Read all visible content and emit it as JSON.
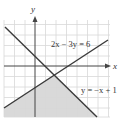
{
  "graph": {
    "axis_labels": {
      "x": "x",
      "y": "y"
    },
    "equations": [
      {
        "label": "2x − 3y = 6",
        "slope": 0.6667,
        "intercept": -2
      },
      {
        "label": "y = −x + 1",
        "slope": -1,
        "intercept": 1
      }
    ],
    "shaded_region": "below both lines",
    "intersection": {
      "x": 1.8,
      "y": -0.8
    },
    "colors": {
      "grid": "#d8d8d8",
      "axis": "#444444",
      "line": "#3a3a3a",
      "shade": "#d9d9d9"
    }
  }
}
